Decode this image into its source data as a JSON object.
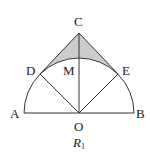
{
  "diagram": {
    "caption": "R",
    "caption_subscript": "1",
    "points": {
      "A": "A",
      "B": "B",
      "C": "C",
      "D": "D",
      "E": "E",
      "M": "M",
      "O": "O"
    },
    "colors": {
      "stroke": "#333333",
      "shaded_region": "#cccccc"
    }
  }
}
